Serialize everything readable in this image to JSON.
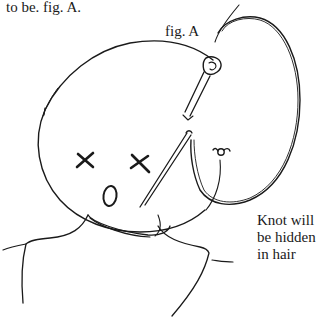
{
  "document": {
    "intro_text": "to be. fig. A.",
    "figure_label": "fig. A",
    "caption_lines": [
      "Knot will",
      "be hidden",
      "in hair"
    ]
  },
  "illustration": {
    "subject": "doll head with needle and thread",
    "elements": [
      "head-outline",
      "x-eye-left",
      "x-eye-right",
      "mouth-o",
      "needle",
      "thread-loop",
      "knot",
      "neck-collar",
      "shoulders"
    ],
    "stroke_color": "#1a1a1a",
    "background_color": "#ffffff"
  }
}
